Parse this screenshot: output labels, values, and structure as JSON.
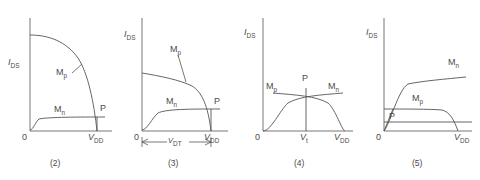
{
  "figure": {
    "type": "technical-diagram",
    "axis": {
      "y_label_text": "I",
      "y_label_sub": "DS",
      "origin_label": "0",
      "x_end_text": "V",
      "x_end_sub": "DD"
    },
    "panels": [
      {
        "id": "panel-2",
        "caption": "(2)",
        "curve_labels": [
          {
            "name": "Mp",
            "text": "M",
            "sub": "p"
          },
          {
            "name": "Mn",
            "text": "M",
            "sub": "n"
          },
          {
            "name": "P",
            "text": "P",
            "sub": ""
          }
        ],
        "x_ticks": [
          {
            "text": "0",
            "sub": ""
          },
          {
            "text": "V",
            "sub": "DD"
          }
        ],
        "y_label": {
          "text": "I",
          "sub": "DS"
        }
      },
      {
        "id": "panel-3",
        "caption": "(3)",
        "curve_labels": [
          {
            "name": "Mp",
            "text": "M",
            "sub": "p"
          },
          {
            "name": "Mn",
            "text": "M",
            "sub": "n"
          },
          {
            "name": "P",
            "text": "P",
            "sub": ""
          }
        ],
        "x_ticks": [
          {
            "text": "0",
            "sub": ""
          },
          {
            "text": "V",
            "sub": "DD"
          }
        ],
        "y_label": {
          "text": "I",
          "sub": "DS"
        },
        "dimension_label": {
          "text": "V",
          "sub": "DT"
        }
      },
      {
        "id": "panel-4",
        "caption": "(4)",
        "curve_labels": [
          {
            "name": "Mp",
            "text": "M",
            "sub": "p"
          },
          {
            "name": "Mn",
            "text": "M",
            "sub": "n"
          },
          {
            "name": "P",
            "text": "P",
            "sub": ""
          }
        ],
        "x_ticks": [
          {
            "text": "0",
            "sub": ""
          },
          {
            "text": "V",
            "sub": "t"
          },
          {
            "text": "V",
            "sub": "DD"
          }
        ],
        "y_label": {
          "text": "I",
          "sub": "DS"
        }
      },
      {
        "id": "panel-5",
        "caption": "(5)",
        "curve_labels": [
          {
            "name": "Mn",
            "text": "M",
            "sub": "n"
          },
          {
            "name": "Mp",
            "text": "M",
            "sub": "p"
          },
          {
            "name": "P",
            "text": "P",
            "sub": ""
          }
        ],
        "x_ticks": [
          {
            "text": "0",
            "sub": ""
          },
          {
            "text": "V",
            "sub": "DD"
          }
        ],
        "y_label": {
          "text": "I",
          "sub": "DS"
        }
      }
    ]
  },
  "colors": {
    "curve": "#555555",
    "axis": "#666666",
    "text": "#4a4a4a",
    "background": "#ffffff"
  }
}
